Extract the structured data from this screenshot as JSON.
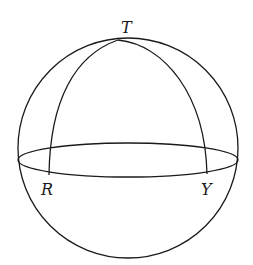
{
  "diagram": {
    "type": "spherical-triangle-on-sphere",
    "labels": {
      "top": "T",
      "left": "R",
      "right": "Y"
    },
    "colors": {
      "stroke": "#1a1a1a",
      "background": "#ffffff"
    }
  }
}
